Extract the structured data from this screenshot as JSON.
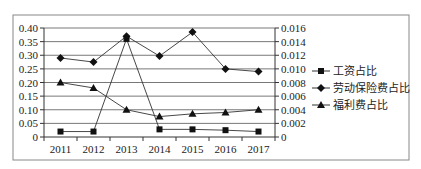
{
  "chart_data": {
    "type": "line",
    "title": "",
    "xlabel": "",
    "ylabel": "",
    "categories": [
      "2011",
      "2012",
      "2013",
      "2014",
      "2015",
      "2016",
      "2017"
    ],
    "y_left": {
      "range": [
        0,
        0.4
      ],
      "ticks": [
        "0",
        "0.05",
        "0.10",
        "0.15",
        "0.20",
        "0.25",
        "0.30",
        "0.35",
        "0.40"
      ]
    },
    "y_right": {
      "range": [
        0,
        0.016
      ],
      "ticks": [
        "0",
        "0.002",
        "0.004",
        "0.006",
        "0.008",
        "0.010",
        "0.012",
        "0.014",
        "0.016"
      ]
    },
    "grid": true,
    "legend_position": "right",
    "series": [
      {
        "name": "工资占比",
        "marker": "square",
        "axis": "left",
        "values": [
          0.02,
          0.02,
          0.36,
          0.028,
          0.028,
          0.025,
          0.02
        ]
      },
      {
        "name": "劳动保险费占比",
        "marker": "diamond",
        "axis": "left",
        "values": [
          0.29,
          0.275,
          0.37,
          0.297,
          0.385,
          0.25,
          0.24
        ]
      },
      {
        "name": "福利费占比",
        "marker": "triangle",
        "axis": "left",
        "values": [
          0.2,
          0.18,
          0.1,
          0.075,
          0.085,
          0.09,
          0.1
        ]
      }
    ]
  },
  "colors": {
    "line": "#333333",
    "grid": "#555555",
    "border": "#888888"
  }
}
